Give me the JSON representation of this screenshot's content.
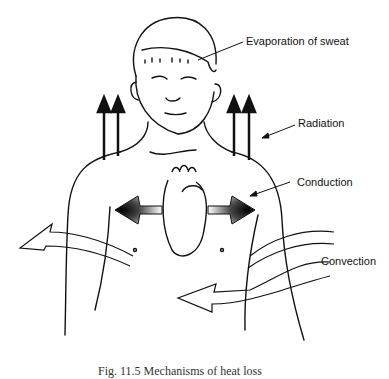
{
  "figure": {
    "labels": {
      "evaporation": "Evaporation of sweat",
      "radiation": "Radiation",
      "conduction": "Conduction",
      "convection": "Convection"
    },
    "caption": "Fig. 11.5 Mechanisms of heat loss",
    "colors": {
      "ink": "#111111",
      "background": "#ffffff"
    }
  }
}
